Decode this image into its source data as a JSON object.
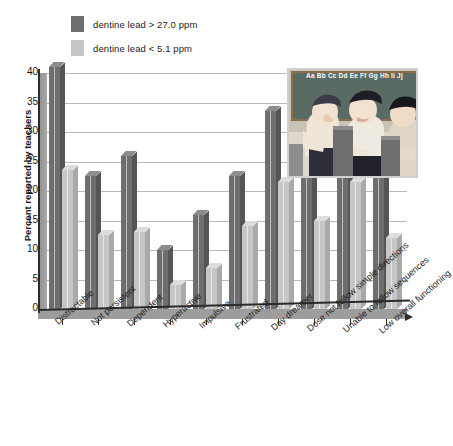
{
  "chart_data": {
    "type": "bar",
    "title": "",
    "subtitle": "",
    "xlabel": "",
    "ylabel": "Percent reported by teachers",
    "ylim": [
      0,
      40
    ],
    "yticks": [
      0,
      5,
      10,
      15,
      20,
      25,
      30,
      35,
      40
    ],
    "grid": true,
    "legend_position": "top-left",
    "categories": [
      "Distractable",
      "Not persistent",
      "Dependent",
      "Hyperactive",
      "Impulsive",
      "Frustrated",
      "Day dreamer",
      "Dose not follow simple directions",
      "Unable to follow sequences",
      "Low overall functioning"
    ],
    "series": [
      {
        "name": "dentine lead > 27.0 ppm",
        "color": "#6e6e6e",
        "values": [
          41.0,
          22.5,
          26.0,
          10.0,
          16.0,
          22.5,
          33.5,
          28.0,
          34.5,
          25.5
        ]
      },
      {
        "name": "dentine lead < 5.1 ppm",
        "color": "#c6c6c6",
        "values": [
          23.5,
          12.5,
          13.0,
          4.0,
          7.0,
          14.0,
          21.5,
          15.0,
          21.5,
          12.0
        ]
      }
    ]
  },
  "legend": {
    "items": [
      {
        "label": "dentine lead > 27.0 ppm",
        "color": "#6e6e6e"
      },
      {
        "label": "dentine lead < 5.1 ppm",
        "color": "#c6c6c6"
      }
    ]
  },
  "inset": {
    "name": "classroom-illustration",
    "chalkboard_text": "Aa Bb Cc Dd Ee Ff Gg Hh Ii Jj",
    "description": "children at school desks in a classroom"
  },
  "colors": {
    "dark_series": "#6e6e6e",
    "light_series": "#c6c6c6",
    "axis": "#2b2b2b",
    "grid": "#b9b9b9",
    "wall": "#9d9d9d"
  }
}
